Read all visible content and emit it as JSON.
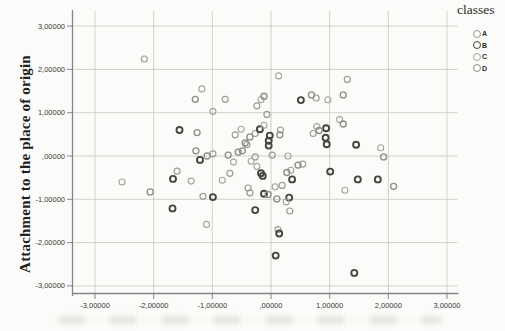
{
  "chart_data": {
    "type": "scatter",
    "title": "",
    "xlabel": "",
    "ylabel": "Attachment to the place of origin",
    "xlim": [
      -3.4,
      3.2
    ],
    "ylim": [
      -3.2,
      3.35
    ],
    "grid": true,
    "marker": {
      "shape": "circle",
      "fill": "none",
      "radius": 3
    },
    "colors": {
      "grid": "#c6c6c2",
      "axis": "#85858a",
      "tick_text": "#3a3a38"
    },
    "x_ticks": [
      {
        "value": -3,
        "label": "-3,00000"
      },
      {
        "value": -2,
        "label": "-2,00000"
      },
      {
        "value": -1,
        "label": "-1,00000"
      },
      {
        "value": 0,
        "label": ",00000"
      },
      {
        "value": 1,
        "label": "1,00000"
      },
      {
        "value": 2,
        "label": "2,00000"
      },
      {
        "value": 3,
        "label": "3,00000"
      }
    ],
    "y_ticks": [
      {
        "value": 3,
        "label": "3,00000"
      },
      {
        "value": 2,
        "label": "2,00000"
      },
      {
        "value": 1,
        "label": "1,00000"
      },
      {
        "value": 0,
        "label": ",00000"
      },
      {
        "value": -1,
        "label": "-1,00000"
      },
      {
        "value": -2,
        "label": "-2,00000"
      },
      {
        "value": -3,
        "label": "-3,00000"
      }
    ],
    "legend": {
      "title": "classes",
      "position": "top-right-outside"
    },
    "series": [
      {
        "name": "A",
        "color": "#9c9c98",
        "stroke_width": 1.2,
        "points": [
          [
            -2.16,
            2.24
          ],
          [
            -0.78,
            1.31
          ],
          [
            -0.61,
            0.49
          ],
          [
            -0.27,
            0.52
          ],
          [
            -0.24,
            1.16
          ],
          [
            -0.07,
            0.96
          ],
          [
            0.77,
            1.34
          ],
          [
            1.3,
            1.77
          ],
          [
            0.16,
            0.6
          ],
          [
            0.72,
            0.52
          ],
          [
            0.02,
            0.02
          ],
          [
            -0.27,
            -0.02
          ],
          [
            -0.41,
            0.26
          ],
          [
            -1.6,
            -0.35
          ],
          [
            -1.16,
            -0.93
          ],
          [
            -0.99,
            0.05
          ],
          [
            -0.7,
            -0.4
          ],
          [
            -0.39,
            -0.74
          ],
          [
            -0.36,
            -0.85
          ],
          [
            0.19,
            -0.68
          ],
          [
            0.32,
            -1.27
          ],
          [
            0.54,
            -0.19
          ],
          [
            0.12,
            -1.7
          ]
        ]
      },
      {
        "name": "B",
        "color": "#454541",
        "stroke_width": 1.9,
        "points": [
          [
            -1.56,
            0.6
          ],
          [
            -0.19,
            0.62
          ],
          [
            -0.02,
            0.47
          ],
          [
            -0.04,
            0.35
          ],
          [
            -0.04,
            0.24
          ],
          [
            0.51,
            1.29
          ],
          [
            0.94,
            0.64
          ],
          [
            0.93,
            0.42
          ],
          [
            0.95,
            0.27
          ],
          [
            1.45,
            0.26
          ],
          [
            -1.67,
            -0.53
          ],
          [
            -1.68,
            -1.21
          ],
          [
            -1.21,
            -0.09
          ],
          [
            -0.99,
            -0.95
          ],
          [
            -0.17,
            -0.4
          ],
          [
            -0.14,
            -0.46
          ],
          [
            -0.12,
            -0.87
          ],
          [
            -0.27,
            -1.25
          ],
          [
            0.31,
            -0.96
          ],
          [
            0.36,
            -0.54
          ],
          [
            1.01,
            -0.36
          ],
          [
            1.48,
            -0.54
          ],
          [
            1.82,
            -0.54
          ],
          [
            0.14,
            -1.79
          ],
          [
            0.08,
            -2.3
          ],
          [
            1.42,
            -2.7
          ]
        ]
      },
      {
        "name": "C",
        "color": "#a4a4a0",
        "stroke_width": 1.1,
        "points": [
          [
            -1.18,
            1.55
          ],
          [
            -0.99,
            1.03
          ],
          [
            -0.51,
            0.62
          ],
          [
            -0.12,
            0.71
          ],
          [
            -0.17,
            1.3
          ],
          [
            0.13,
            1.85
          ],
          [
            0.97,
            1.3
          ],
          [
            1.17,
            0.84
          ],
          [
            0.78,
            0.68
          ],
          [
            1.87,
            0.19
          ],
          [
            0.29,
            0.0
          ],
          [
            -0.34,
            -0.12
          ],
          [
            -2.54,
            -0.6
          ],
          [
            -1.36,
            -0.58
          ],
          [
            -1.1,
            -1.58
          ],
          [
            -0.83,
            -0.56
          ],
          [
            -0.64,
            -0.14
          ],
          [
            -0.24,
            -0.24
          ],
          [
            0.07,
            -0.71
          ],
          [
            0.26,
            -1.06
          ],
          [
            0.34,
            -0.33
          ],
          [
            1.26,
            -0.79
          ]
        ]
      },
      {
        "name": "D",
        "color": "#8d8d89",
        "stroke_width": 1.35,
        "points": [
          [
            -1.29,
            1.31
          ],
          [
            -1.26,
            0.54
          ],
          [
            -0.36,
            0.44
          ],
          [
            -0.44,
            0.3
          ],
          [
            -0.12,
            1.38
          ],
          [
            0.69,
            1.41
          ],
          [
            1.23,
            1.41
          ],
          [
            1.23,
            0.74
          ],
          [
            0.82,
            0.59
          ],
          [
            1.92,
            -0.02
          ],
          [
            0.15,
            0.49
          ],
          [
            -0.49,
            0.12
          ],
          [
            -2.06,
            -0.83
          ],
          [
            -1.28,
            0.12
          ],
          [
            -1.09,
            0.0
          ],
          [
            -0.73,
            0.02
          ],
          [
            -0.56,
            0.09
          ],
          [
            -0.05,
            -0.89
          ],
          [
            0.1,
            -0.99
          ],
          [
            0.27,
            -0.38
          ],
          [
            0.46,
            -0.21
          ],
          [
            2.09,
            -0.7
          ]
        ]
      }
    ]
  }
}
